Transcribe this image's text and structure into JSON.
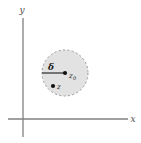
{
  "figure": {
    "background_color": "#ffffff"
  },
  "axes": {
    "x_label": "x",
    "y_label": "y",
    "axis_color": "#808080",
    "x_axis": {
      "x1": 8,
      "y1": 119,
      "x2": 128,
      "y2": 119
    },
    "y_axis": {
      "x1": 23,
      "y1": 18,
      "x2": 23,
      "y2": 137
    },
    "x_label_pos": {
      "x": 133,
      "y": 121
    },
    "y_label_pos": {
      "x": 20,
      "y": 13
    }
  },
  "disk": {
    "center": {
      "x": 65,
      "y": 73
    },
    "radius": 23,
    "fill_color": "#e0e0e0",
    "border_color": "#9a9a9a",
    "border_style": "dashed",
    "radius_label": "δ",
    "radius_label_pos": {
      "x": 49,
      "y": 70
    },
    "radius_line": {
      "x1": 42,
      "y1": 73,
      "x2": 64,
      "y2": 73
    }
  },
  "points": [
    {
      "name": "center-point",
      "label": "z",
      "subscript": "0",
      "x": 65,
      "y": 73,
      "label_x": 69,
      "label_y": 77,
      "sub_x": 74,
      "sub_y": 79,
      "color": "#111111",
      "radius": 2.1
    },
    {
      "name": "interior-point",
      "label": "z",
      "subscript": "",
      "x": 53,
      "y": 86,
      "label_x": 57,
      "label_y": 89,
      "sub_x": 0,
      "sub_y": 0,
      "color": "#111111",
      "radius": 2.1
    }
  ]
}
